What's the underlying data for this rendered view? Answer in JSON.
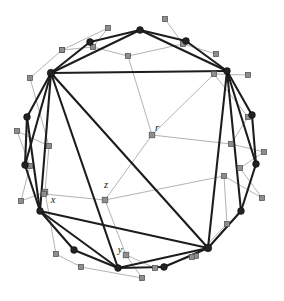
{
  "figure": {
    "width": 284,
    "height": 301,
    "background_color": "#ffffff",
    "colors": {
      "primary_edge": "#1d1d1d",
      "primary_node": "#232323",
      "secondary_edge": "#9a9a9a",
      "secondary_node": "#8e8e8e",
      "secondary_node_border": "#4f4f4f",
      "label_text": "#1a1a1a"
    }
  },
  "labels": [
    {
      "id": "label-r",
      "text": "r",
      "x": 157,
      "y": 131
    },
    {
      "id": "label-z",
      "text": "z",
      "x": 106,
      "y": 188
    },
    {
      "id": "label-x",
      "text": "x",
      "x": 53,
      "y": 203
    },
    {
      "id": "label-y",
      "text": "y",
      "x": 120,
      "y": 253
    }
  ],
  "primary_nodes": [
    {
      "id": "p0",
      "x": 140,
      "y": 30,
      "r": 3.4
    },
    {
      "id": "p1",
      "x": 186,
      "y": 41,
      "r": 3.4
    },
    {
      "id": "p2",
      "x": 227,
      "y": 71,
      "r": 3.4
    },
    {
      "id": "p3",
      "x": 252,
      "y": 115,
      "r": 3.4
    },
    {
      "id": "p4",
      "x": 256,
      "y": 164,
      "r": 3.4
    },
    {
      "id": "p5",
      "x": 241,
      "y": 211,
      "r": 3.4
    },
    {
      "id": "p6",
      "x": 208,
      "y": 248,
      "r": 3.8
    },
    {
      "id": "p7",
      "x": 164,
      "y": 267,
      "r": 3.4
    },
    {
      "id": "p8",
      "x": 118,
      "y": 268,
      "r": 3.4
    },
    {
      "id": "p9",
      "x": 74,
      "y": 250,
      "r": 3.4
    },
    {
      "id": "p10",
      "x": 40,
      "y": 211,
      "r": 3.4
    },
    {
      "id": "p11",
      "x": 25,
      "y": 165,
      "r": 3.4
    },
    {
      "id": "p12",
      "x": 27,
      "y": 117,
      "r": 3.4
    },
    {
      "id": "p13",
      "x": 51,
      "y": 73,
      "r": 3.8
    },
    {
      "id": "p14",
      "x": 90,
      "y": 42,
      "r": 3.4
    }
  ],
  "primary_edges": [
    {
      "from": "p13",
      "to": "p14",
      "weight": "heavy"
    },
    {
      "from": "p14",
      "to": "p0",
      "weight": "heavy"
    },
    {
      "from": "p0",
      "to": "p1",
      "weight": "heavy"
    },
    {
      "from": "p1",
      "to": "p2",
      "weight": "heavy"
    },
    {
      "from": "p13",
      "to": "p0",
      "weight": "heavy"
    },
    {
      "from": "p0",
      "to": "p2",
      "weight": "heavy"
    },
    {
      "from": "p13",
      "to": "p2",
      "weight": "heavy"
    },
    {
      "from": "p2",
      "to": "p3",
      "weight": "heavy"
    },
    {
      "from": "p3",
      "to": "p4",
      "weight": "heavy"
    },
    {
      "from": "p2",
      "to": "p4",
      "weight": "heavy"
    },
    {
      "from": "p4",
      "to": "p5",
      "weight": "heavy"
    },
    {
      "from": "p2",
      "to": "p5",
      "weight": "heavy"
    },
    {
      "from": "p5",
      "to": "p6",
      "weight": "heavy"
    },
    {
      "from": "p2",
      "to": "p6",
      "weight": "heavy"
    },
    {
      "from": "p6",
      "to": "p7",
      "weight": "heavy"
    },
    {
      "from": "p7",
      "to": "p8",
      "weight": "heavy"
    },
    {
      "from": "p6",
      "to": "p8",
      "weight": "heavy"
    },
    {
      "from": "p8",
      "to": "p9",
      "weight": "heavy"
    },
    {
      "from": "p9",
      "to": "p10",
      "weight": "heavy"
    },
    {
      "from": "p8",
      "to": "p10",
      "weight": "heavy"
    },
    {
      "from": "p10",
      "to": "p11",
      "weight": "heavy"
    },
    {
      "from": "p11",
      "to": "p12",
      "weight": "heavy"
    },
    {
      "from": "p10",
      "to": "p12",
      "weight": "heavy"
    },
    {
      "from": "p12",
      "to": "p13",
      "weight": "heavy"
    },
    {
      "from": "p13",
      "to": "p11",
      "weight": "heavy"
    },
    {
      "from": "p13",
      "to": "p10",
      "weight": "heavy"
    },
    {
      "from": "p13",
      "to": "p8",
      "weight": "heavy"
    },
    {
      "from": "p13",
      "to": "p6",
      "weight": "heavy"
    },
    {
      "from": "p6",
      "to": "p10",
      "weight": "heavy"
    }
  ],
  "secondary_nodes": [
    {
      "id": "s-r",
      "x": 152,
      "y": 135,
      "size": 5.6,
      "label": "r"
    },
    {
      "id": "s-z",
      "x": 105,
      "y": 200,
      "size": 5.6,
      "label": "z"
    },
    {
      "id": "s-x",
      "x": 45,
      "y": 192,
      "size": 5.6,
      "label": "x"
    },
    {
      "id": "s-y",
      "x": 126,
      "y": 255,
      "size": 5.6,
      "label": "y"
    },
    {
      "id": "s1",
      "x": 128,
      "y": 56,
      "size": 5.2,
      "label": ""
    },
    {
      "id": "s2",
      "x": 93,
      "y": 47,
      "size": 5.2,
      "label": ""
    },
    {
      "id": "s3",
      "x": 108,
      "y": 28,
      "size": 5.2,
      "label": ""
    },
    {
      "id": "s4",
      "x": 62,
      "y": 50,
      "size": 5.2,
      "label": ""
    },
    {
      "id": "s5",
      "x": 165,
      "y": 19,
      "size": 5.2,
      "label": ""
    },
    {
      "id": "s6",
      "x": 183,
      "y": 44,
      "size": 5.2,
      "label": ""
    },
    {
      "id": "s7",
      "x": 216,
      "y": 54,
      "size": 5.2,
      "label": ""
    },
    {
      "id": "s8",
      "x": 214,
      "y": 74,
      "size": 5.2,
      "label": ""
    },
    {
      "id": "s9",
      "x": 248,
      "y": 75,
      "size": 5.2,
      "label": ""
    },
    {
      "id": "s10",
      "x": 248,
      "y": 117,
      "size": 5.2,
      "label": ""
    },
    {
      "id": "s11",
      "x": 231,
      "y": 144,
      "size": 5.2,
      "label": ""
    },
    {
      "id": "s12",
      "x": 264,
      "y": 152,
      "size": 5.2,
      "label": ""
    },
    {
      "id": "s13",
      "x": 240,
      "y": 168,
      "size": 5.2,
      "label": ""
    },
    {
      "id": "s14",
      "x": 262,
      "y": 198,
      "size": 5.2,
      "label": ""
    },
    {
      "id": "s15",
      "x": 224,
      "y": 176,
      "size": 5.2,
      "label": ""
    },
    {
      "id": "s16",
      "x": 227,
      "y": 224,
      "size": 5.2,
      "label": ""
    },
    {
      "id": "s17",
      "x": 196,
      "y": 256,
      "size": 5.2,
      "label": ""
    },
    {
      "id": "s18",
      "x": 192,
      "y": 257,
      "size": 5.2,
      "label": ""
    },
    {
      "id": "s19",
      "x": 155,
      "y": 268,
      "size": 5.2,
      "label": ""
    },
    {
      "id": "s20",
      "x": 142,
      "y": 278,
      "size": 5.2,
      "label": ""
    },
    {
      "id": "s21",
      "x": 81,
      "y": 267,
      "size": 5.2,
      "label": ""
    },
    {
      "id": "s22",
      "x": 56,
      "y": 254,
      "size": 5.2,
      "label": ""
    },
    {
      "id": "s23",
      "x": 44,
      "y": 194,
      "size": 5.2,
      "label": ""
    },
    {
      "id": "s24",
      "x": 21,
      "y": 201,
      "size": 5.2,
      "label": ""
    },
    {
      "id": "s25",
      "x": 30,
      "y": 166,
      "size": 5.2,
      "label": ""
    },
    {
      "id": "s26",
      "x": 17,
      "y": 131,
      "size": 5.2,
      "label": ""
    },
    {
      "id": "s27",
      "x": 49,
      "y": 146,
      "size": 5.2,
      "label": ""
    },
    {
      "id": "s28",
      "x": 30,
      "y": 78,
      "size": 5.2,
      "label": ""
    },
    {
      "id": "s29",
      "x": 62,
      "y": 50,
      "size": 5.2,
      "label": ""
    }
  ],
  "secondary_edges": [
    {
      "from": "s-r",
      "to": "s1"
    },
    {
      "from": "s-r",
      "to": "s11"
    },
    {
      "from": "s-r",
      "to": "s-z"
    },
    {
      "from": "s-z",
      "to": "s23"
    },
    {
      "from": "s-z",
      "to": "s-y"
    },
    {
      "from": "s-y",
      "to": "s19"
    },
    {
      "from": "s-y",
      "to": "s20"
    },
    {
      "from": "s-x",
      "to": "s27"
    },
    {
      "from": "s-x",
      "to": "s22"
    },
    {
      "from": "s-x",
      "to": "s24"
    },
    {
      "from": "s1",
      "to": "s2"
    },
    {
      "from": "s2",
      "to": "s3"
    },
    {
      "from": "s2",
      "to": "s4"
    },
    {
      "from": "s1",
      "to": "s6"
    },
    {
      "from": "s6",
      "to": "s5"
    },
    {
      "from": "s6",
      "to": "s7"
    },
    {
      "from": "s8",
      "to": "s9"
    },
    {
      "from": "s8",
      "to": "s10"
    },
    {
      "from": "s11",
      "to": "s10"
    },
    {
      "from": "s11",
      "to": "s12"
    },
    {
      "from": "s13",
      "to": "s12"
    },
    {
      "from": "s13",
      "to": "s14"
    },
    {
      "from": "s15",
      "to": "s14"
    },
    {
      "from": "s15",
      "to": "s16"
    },
    {
      "from": "s17",
      "to": "s16"
    },
    {
      "from": "s18",
      "to": "s19"
    },
    {
      "from": "s21",
      "to": "s20"
    },
    {
      "from": "s22",
      "to": "s21"
    },
    {
      "from": "s24",
      "to": "s25"
    },
    {
      "from": "s25",
      "to": "s26"
    },
    {
      "from": "s27",
      "to": "s26"
    },
    {
      "from": "s27",
      "to": "s28"
    },
    {
      "from": "s29",
      "to": "s28"
    },
    {
      "from": "s29",
      "to": "s3"
    },
    {
      "from": "s-r",
      "to": "s8"
    },
    {
      "from": "s-z",
      "to": "s15"
    }
  ]
}
